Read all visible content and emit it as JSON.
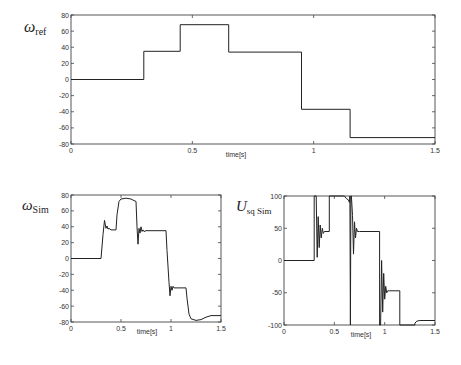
{
  "chart_data": [
    {
      "id": "omega_ref",
      "type": "line",
      "title": "",
      "ylabel_main": "ω",
      "ylabel_sub": "ref",
      "xlabel": "time[s]",
      "xlim": [
        0,
        1.5
      ],
      "ylim": [
        -80,
        80
      ],
      "xticks": [
        0,
        0.5,
        1,
        1.5
      ],
      "xtick_labels": [
        "0",
        "0.5",
        "1",
        "1.5"
      ],
      "yticks": [
        80,
        60,
        40,
        20,
        0,
        -20,
        -40,
        -60,
        -80
      ],
      "ytick_labels": [
        "80",
        "60",
        "40",
        "20",
        "0",
        "-20",
        "-40",
        "-60",
        "-80"
      ],
      "grid": false,
      "series": [
        {
          "name": "omega_ref",
          "x": [
            0,
            0.3,
            0.3,
            0.45,
            0.45,
            0.65,
            0.65,
            0.95,
            0.95,
            1.15,
            1.15,
            1.5
          ],
          "y": [
            0,
            0,
            35,
            35,
            68,
            68,
            34,
            34,
            -37,
            -37,
            -72,
            -72
          ]
        }
      ],
      "box": {
        "left": 71,
        "top": 15,
        "right": 435,
        "bottom": 144
      }
    },
    {
      "id": "omega_sim",
      "type": "line",
      "title": "",
      "ylabel_main": "ω",
      "ylabel_sub": "Sim",
      "xlabel": "time[s]",
      "xlim": [
        0,
        1.5
      ],
      "ylim": [
        -80,
        80
      ],
      "xticks": [
        0,
        0.5,
        1,
        1.5
      ],
      "xtick_labels": [
        "0",
        "0.5",
        "1",
        "1.5"
      ],
      "yticks": [
        80,
        60,
        40,
        20,
        0,
        -20,
        -40,
        -60,
        -80
      ],
      "ytick_labels": [
        "80",
        "60",
        "40",
        "20",
        "0",
        "-20",
        "-40",
        "-60",
        "-80"
      ],
      "grid": false,
      "series": [
        {
          "name": "omega_sim",
          "x": [
            0,
            0.3,
            0.32,
            0.335,
            0.35,
            0.36,
            0.37,
            0.38,
            0.4,
            0.45,
            0.46,
            0.48,
            0.5,
            0.55,
            0.6,
            0.63,
            0.65,
            0.66,
            0.67,
            0.68,
            0.69,
            0.7,
            0.71,
            0.72,
            0.73,
            0.75,
            0.95,
            0.96,
            0.98,
            0.99,
            1.0,
            1.01,
            1.02,
            1.03,
            1.05,
            1.15,
            1.16,
            1.18,
            1.2,
            1.25,
            1.3,
            1.35,
            1.4,
            1.5
          ],
          "y": [
            0,
            0,
            30,
            48,
            38,
            41,
            37,
            38,
            36,
            36,
            55,
            72,
            75,
            76,
            75,
            73,
            72,
            40,
            18,
            38,
            32,
            40,
            34,
            36,
            34,
            35,
            35,
            10,
            -30,
            -47,
            -35,
            -40,
            -35,
            -37,
            -37,
            -37,
            -50,
            -70,
            -76,
            -78,
            -77,
            -74,
            -72,
            -72
          ]
        }
      ],
      "box": {
        "left": 71,
        "top": 195,
        "right": 221,
        "bottom": 322
      }
    },
    {
      "id": "usq_sim",
      "type": "line",
      "title": "",
      "ylabel_main": "U",
      "ylabel_sub": "sq Sim",
      "xlabel": "time[s]",
      "xlim": [
        0,
        1.5
      ],
      "ylim": [
        -100,
        100
      ],
      "xticks": [
        0,
        0.5,
        1,
        1.5
      ],
      "xtick_labels": [
        "0",
        "0.5",
        "1",
        "1.5"
      ],
      "yticks": [
        100,
        50,
        0,
        -50,
        -100
      ],
      "ytick_labels": [
        "100",
        "50",
        "0",
        "-50",
        "-100"
      ],
      "grid": false,
      "series": [
        {
          "name": "usq_sim",
          "x": [
            0,
            0.3,
            0.3,
            0.32,
            0.33,
            0.34,
            0.35,
            0.36,
            0.37,
            0.38,
            0.39,
            0.4,
            0.45,
            0.45,
            0.6,
            0.62,
            0.64,
            0.65,
            0.655,
            0.66,
            0.665,
            0.67,
            0.68,
            0.69,
            0.7,
            0.71,
            0.72,
            0.73,
            0.75,
            0.95,
            0.95,
            0.96,
            0.97,
            0.98,
            0.99,
            1.0,
            1.01,
            1.02,
            1.03,
            1.05,
            1.15,
            1.15,
            1.3,
            1.3,
            1.32,
            1.35,
            1.5
          ],
          "y": [
            0,
            0,
            100,
            100,
            5,
            68,
            20,
            55,
            35,
            50,
            42,
            45,
            45,
            100,
            100,
            96,
            94,
            90,
            100,
            -100,
            100,
            100,
            70,
            10,
            60,
            35,
            50,
            45,
            45,
            45,
            -100,
            -100,
            0,
            -80,
            -20,
            -60,
            -40,
            -50,
            -47,
            -47,
            -47,
            -100,
            -100,
            -97,
            -94,
            -93,
            -93
          ]
        }
      ],
      "box": {
        "left": 284,
        "top": 196,
        "right": 435,
        "bottom": 325
      }
    }
  ]
}
